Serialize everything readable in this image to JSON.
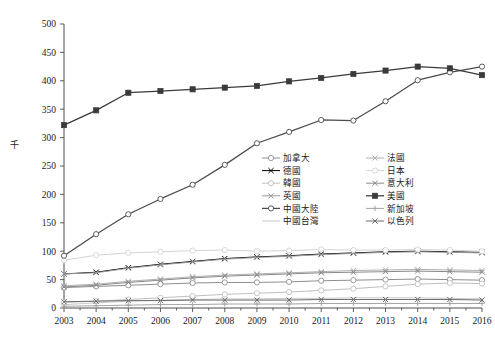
{
  "chart_data": {
    "type": "line",
    "title": "",
    "xlabel": "",
    "ylabel": "千",
    "ylim": [
      0,
      500
    ],
    "ytick_step": 50,
    "yticks": [
      "0",
      "50",
      "100",
      "150",
      "200",
      "250",
      "300",
      "350",
      "400",
      "450",
      "500"
    ],
    "grid": false,
    "legend_position": "inside-center-right",
    "x": [
      "2003",
      "2004",
      "2005",
      "2006",
      "2007",
      "2008",
      "2009",
      "2010",
      "2011",
      "2012",
      "2013",
      "2014",
      "2015",
      "2016"
    ],
    "categories": [
      "2003",
      "2004",
      "2005",
      "2006",
      "2007",
      "2008",
      "2009",
      "2010",
      "2011",
      "2012",
      "2013",
      "2014",
      "2015",
      "2016"
    ],
    "series": [
      {
        "name": "加拿大",
        "marker": "open-circle",
        "color": "#8e8e8e",
        "values": [
          36,
          38,
          40,
          42,
          44,
          45,
          45,
          46,
          48,
          49,
          50,
          51,
          50,
          49
        ]
      },
      {
        "name": "德國",
        "marker": "x-cross",
        "color": "#000000",
        "values": [
          60,
          63,
          71,
          77,
          82,
          87,
          90,
          92,
          95,
          97,
          99,
          100,
          99,
          98
        ]
      },
      {
        "name": "韓國",
        "marker": "open-circle",
        "color": "#bfbfbf",
        "values": [
          10,
          12,
          15,
          18,
          21,
          24,
          26,
          28,
          31,
          34,
          38,
          42,
          44,
          43
        ]
      },
      {
        "name": "英國",
        "marker": "x-cross",
        "color": "#9a9a9a",
        "values": [
          60,
          62,
          70,
          76,
          81,
          86,
          89,
          91,
          94,
          96,
          98,
          99,
          98,
          97
        ]
      },
      {
        "name": "中國大陸",
        "marker": "open-circle",
        "color": "#4a4a4a",
        "values": [
          92,
          130,
          165,
          192,
          217,
          252,
          290,
          310,
          331,
          330,
          364,
          401,
          415,
          425
        ]
      },
      {
        "name": "中國台灣",
        "marker": "none",
        "color": "#c9c9c9",
        "values": [
          6,
          9,
          12,
          14,
          15,
          16,
          16,
          17,
          17,
          18,
          18,
          18,
          17,
          16
        ]
      },
      {
        "name": "法國",
        "marker": "x-cross",
        "color": "#b0b0b0",
        "values": [
          39,
          42,
          47,
          51,
          55,
          58,
          60,
          62,
          64,
          66,
          67,
          68,
          67,
          66
        ]
      },
      {
        "name": "日本",
        "marker": "open-circle",
        "color": "#d4d4d4",
        "values": [
          84,
          93,
          97,
          99,
          101,
          102,
          100,
          101,
          103,
          102,
          102,
          103,
          102,
          100
        ]
      },
      {
        "name": "意大利",
        "marker": "x-cross",
        "color": "#8a8a8a",
        "values": [
          37,
          40,
          45,
          49,
          53,
          56,
          58,
          60,
          62,
          63,
          64,
          65,
          64,
          63
        ]
      },
      {
        "name": "美國",
        "marker": "filled-square",
        "color": "#3a3a3a",
        "values": [
          322,
          348,
          379,
          382,
          385,
          388,
          391,
          399,
          405,
          412,
          418,
          425,
          422,
          410
        ]
      },
      {
        "name": "新加坡",
        "marker": "plus",
        "color": "#a5a5a5",
        "values": [
          3,
          4,
          5,
          6,
          6,
          7,
          7,
          7,
          8,
          8,
          8,
          8,
          8,
          8
        ]
      },
      {
        "name": "以色列",
        "marker": "x-cross",
        "color": "#6b6b6b",
        "values": [
          11,
          12,
          13,
          13,
          14,
          14,
          14,
          14,
          15,
          15,
          15,
          15,
          15,
          14
        ]
      }
    ]
  },
  "legend": {
    "column_left": [
      "加拿大",
      "德國",
      "韓國",
      "英國",
      "中國大陸",
      "中國台灣"
    ],
    "column_right": [
      "法國",
      "日本",
      "意大利",
      "美國",
      "新加坡",
      "以色列"
    ]
  }
}
